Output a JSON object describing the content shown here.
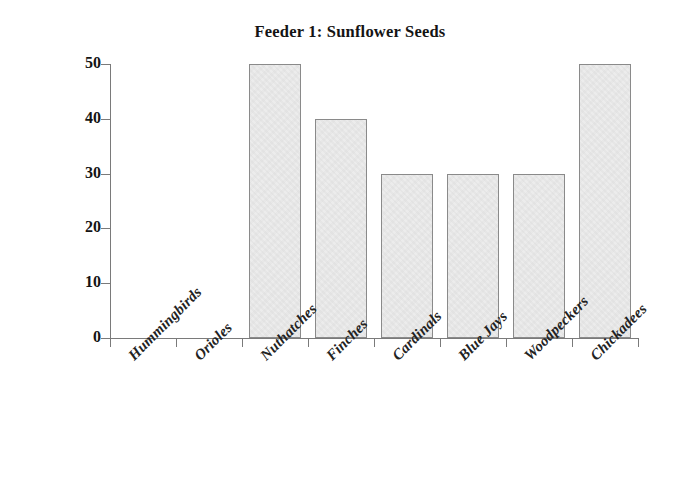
{
  "chart_data": {
    "type": "bar",
    "title": "Feeder 1: Sunflower Seeds",
    "xlabel": "",
    "ylabel": "",
    "categories": [
      "Hummingbirds",
      "Orioles",
      "Nuthatches",
      "Finches",
      "Cardinals",
      "Blue Jays",
      "Woodpeckers",
      "Chickadees"
    ],
    "values": [
      0,
      0,
      50,
      40,
      30,
      30,
      30,
      50
    ],
    "ylim": [
      0,
      50
    ],
    "yticks": [
      0,
      10,
      20,
      30,
      40,
      50
    ],
    "ytick_labels": [
      "0",
      "10",
      "20",
      "30",
      "40",
      "50"
    ],
    "grid": false,
    "legend": false,
    "bar_fill_color": "#ececec",
    "bar_edge_color": "#8a8a8a",
    "axis_color": "#7a7a7a",
    "text_color": "#141414",
    "background_color": "#ffffff",
    "xtick_label_rotation": -45
  }
}
